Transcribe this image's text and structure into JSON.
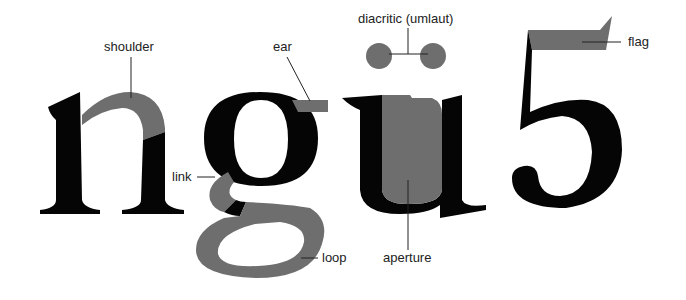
{
  "diagram": {
    "glyphs": [
      "n",
      "g",
      "ü",
      "5"
    ],
    "labels": {
      "shoulder": "shoulder",
      "ear": "ear",
      "diacritic": "diacritic (umlaut)",
      "flag": "flag",
      "link": "link",
      "loop": "loop",
      "aperture": "aperture"
    },
    "colors": {
      "glyph": "#050505",
      "highlight": "#6e6e6e",
      "label": "#222222",
      "background": "#ffffff"
    }
  }
}
